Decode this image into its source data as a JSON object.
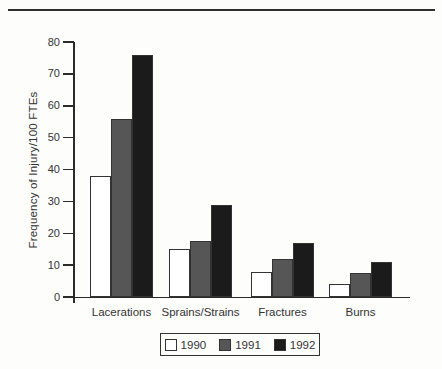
{
  "figure": {
    "top_rule_color": "#2f2f2f",
    "axis_color": "#2b2b2b",
    "text_color": "#333333",
    "background_color": "#fdfdfc",
    "bar_border_color": "#333333"
  },
  "chart_data": {
    "type": "bar",
    "title": "",
    "xlabel": "",
    "ylabel": "Frequency of Injury/100 FTEs",
    "ylim": [
      0,
      80
    ],
    "yticks": [
      0,
      10,
      20,
      30,
      40,
      50,
      60,
      70,
      80
    ],
    "grid": false,
    "legend_position": "bottom",
    "categories": [
      "Lacerations",
      "Sprains/Strains",
      "Fractures",
      "Burns"
    ],
    "series": [
      {
        "name": "1990",
        "color": "#ffffff",
        "values": [
          38,
          15,
          8,
          4
        ]
      },
      {
        "name": "1991",
        "color": "#565656",
        "values": [
          56,
          17.5,
          12,
          7.5
        ]
      },
      {
        "name": "1992",
        "color": "#1b1b1b",
        "values": [
          76,
          29,
          17,
          11
        ]
      }
    ]
  }
}
